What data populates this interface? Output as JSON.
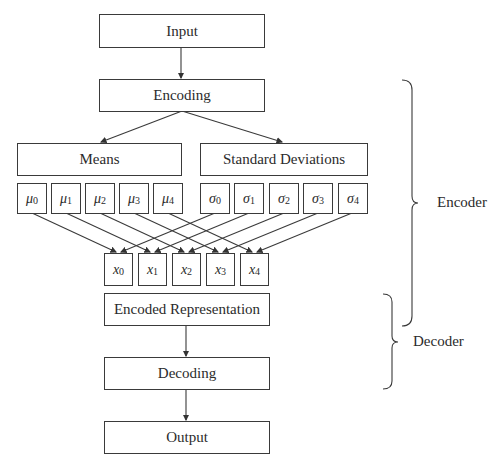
{
  "diagram": {
    "boxes": {
      "input": "Input",
      "encoding": "Encoding",
      "means": "Means",
      "std_devs": "Standard Deviations",
      "encoded_rep": "Encoded Representation",
      "decoding": "Decoding",
      "output": "Output"
    },
    "mu": [
      {
        "sym": "μ",
        "sub": "0"
      },
      {
        "sym": "μ",
        "sub": "1"
      },
      {
        "sym": "μ",
        "sub": "2"
      },
      {
        "sym": "μ",
        "sub": "3"
      },
      {
        "sym": "μ",
        "sub": "4"
      }
    ],
    "sigma": [
      {
        "sym": "σ",
        "sub": "0"
      },
      {
        "sym": "σ",
        "sub": "1"
      },
      {
        "sym": "σ",
        "sub": "2"
      },
      {
        "sym": "σ",
        "sub": "3"
      },
      {
        "sym": "σ",
        "sub": "4"
      }
    ],
    "x": [
      {
        "sym": "x",
        "sub": "0"
      },
      {
        "sym": "x",
        "sub": "1"
      },
      {
        "sym": "x",
        "sub": "2"
      },
      {
        "sym": "x",
        "sub": "3"
      },
      {
        "sym": "x",
        "sub": "4"
      }
    ],
    "groups": {
      "encoder": "Encoder",
      "decoder": "Decoder"
    }
  }
}
